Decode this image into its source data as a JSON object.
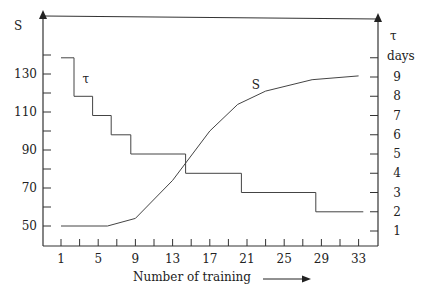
{
  "chart_data": {
    "type": "line",
    "title": "",
    "xlabel": "Number of training",
    "ylabel_left": "S",
    "ylabel_right_symbol": "τ",
    "ylabel_right_unit": "days",
    "x_ticks": [
      1,
      5,
      9,
      13,
      17,
      21,
      25,
      29,
      33
    ],
    "x_minor_ticks": [
      1,
      3,
      5,
      7,
      9,
      11,
      13,
      15,
      17,
      19,
      21,
      23,
      25,
      27,
      29,
      31,
      33
    ],
    "y_left_ticks": [
      50,
      70,
      90,
      110,
      130
    ],
    "y_left_minor_ticks": [
      50,
      60,
      70,
      80,
      90,
      100,
      110,
      120,
      130,
      140
    ],
    "y_right_ticks": [
      1,
      2,
      3,
      4,
      5,
      6,
      7,
      8,
      9
    ],
    "y_right_minor_ticks": [
      1,
      2,
      3,
      4,
      5,
      6,
      7,
      8,
      9,
      10
    ],
    "xlim": [
      -1,
      35
    ],
    "ylim_left": [
      40,
      150
    ],
    "ylim_right": [
      0,
      10.5
    ],
    "grid": false,
    "series": [
      {
        "name": "S",
        "axis": "left",
        "style": "line",
        "label_at": {
          "x": 21.5,
          "y": 122
        },
        "points": [
          [
            1,
            50
          ],
          [
            6,
            50
          ],
          [
            9,
            54
          ],
          [
            13,
            74
          ],
          [
            17,
            100
          ],
          [
            20,
            114
          ],
          [
            23,
            121
          ],
          [
            28,
            127
          ],
          [
            33,
            129
          ]
        ]
      },
      {
        "name": "τ",
        "axis": "right",
        "style": "step",
        "label_at": {
          "x": 3.3,
          "y": 8.7
        },
        "points": [
          [
            1,
            10
          ],
          [
            2.4,
            10
          ],
          [
            2.4,
            8
          ],
          [
            4.4,
            8
          ],
          [
            4.4,
            7
          ],
          [
            6.4,
            7
          ],
          [
            6.4,
            6
          ],
          [
            8.5,
            6
          ],
          [
            8.5,
            5
          ],
          [
            14.4,
            5
          ],
          [
            14.4,
            4
          ],
          [
            20.4,
            4
          ],
          [
            20.4,
            3
          ],
          [
            28.4,
            3
          ],
          [
            28.4,
            2
          ],
          [
            33.5,
            2
          ]
        ]
      }
    ]
  },
  "labels": {
    "left_axis_title": "S",
    "right_axis_symbol": "τ",
    "right_axis_unit": "days",
    "x_axis_title": "Number of training",
    "series_s_label": "S",
    "series_tau_label": "τ"
  }
}
